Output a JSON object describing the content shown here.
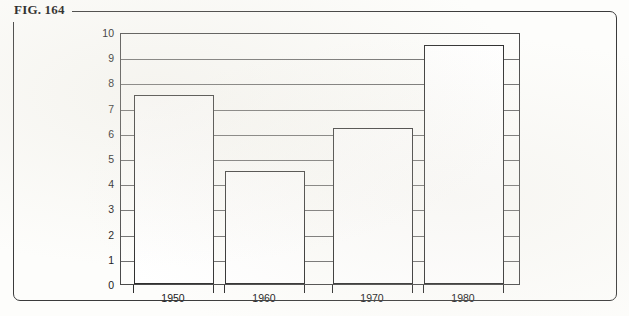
{
  "figure": {
    "label": "FIG. 164"
  },
  "chart_data": {
    "type": "bar",
    "title": "",
    "xlabel": "",
    "ylabel": "",
    "categories": [
      "1950",
      "1960",
      "1970",
      "1980"
    ],
    "values": [
      7.5,
      4.5,
      6.2,
      9.5
    ],
    "ylim": [
      0,
      10
    ],
    "ytick_labels": [
      "10",
      "9",
      "8",
      "7",
      "6",
      "5",
      "4",
      "3",
      "2",
      "1",
      "0"
    ],
    "ytick_values": [
      10,
      9,
      8,
      7,
      6,
      5,
      4,
      3,
      2,
      1,
      0
    ],
    "grid": true,
    "grid_orientation": "horizontal",
    "legend": "none",
    "bar_fill": "#ffffff",
    "bar_outline": "#2f2f2f",
    "gridline_color": "#6e6e6e",
    "axis_color": "#4a4a4a"
  }
}
